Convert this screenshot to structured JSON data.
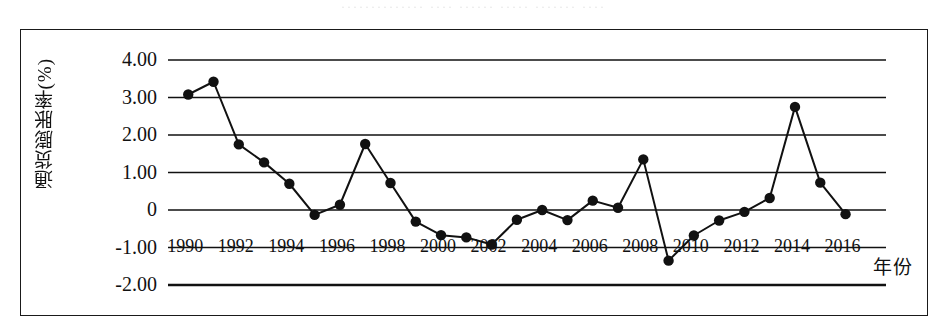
{
  "page": {
    "scan_artifact_text": "·············· ···· ······ ····· ······· ····",
    "background_color": "#ffffff",
    "line_color": "#111111",
    "frame_color": "#1a1a1a"
  },
  "chart_data": {
    "type": "line",
    "title": "",
    "xlabel": "年份",
    "ylabel": "通货膨胀率(%)",
    "x": [
      1990,
      1991,
      1992,
      1993,
      1994,
      1995,
      1996,
      1997,
      1998,
      1999,
      2000,
      2001,
      2002,
      2003,
      2004,
      2005,
      2006,
      2007,
      2008,
      2009,
      2010,
      2011,
      2012,
      2013,
      2014,
      2015,
      2016
    ],
    "values": [
      3.08,
      3.42,
      1.75,
      1.27,
      0.7,
      -0.13,
      0.14,
      1.76,
      0.72,
      -0.31,
      -0.67,
      -0.73,
      -0.92,
      -0.26,
      0.0,
      -0.27,
      0.25,
      0.06,
      1.35,
      -1.35,
      -0.68,
      -0.28,
      -0.05,
      0.32,
      2.75,
      0.73,
      -0.11
    ],
    "series_name": "通货膨胀率",
    "xlim": [
      1989.2,
      2017.6
    ],
    "ylim": [
      -2.0,
      4.0
    ],
    "yticks": [
      "4.00",
      "3.00",
      "2.00",
      "1.00",
      "0",
      "-1.00",
      "-2.00"
    ],
    "ytick_values": [
      4.0,
      3.0,
      2.0,
      1.0,
      0.0,
      -1.0,
      -2.0
    ],
    "xticks": [
      "1990",
      "1992",
      "1994",
      "1996",
      "1998",
      "2000",
      "2002",
      "2004",
      "2006",
      "2008",
      "2010",
      "2012",
      "2014",
      "2016"
    ],
    "xtick_values": [
      1990,
      1992,
      1994,
      1996,
      1998,
      2000,
      2002,
      2004,
      2006,
      2008,
      2010,
      2012,
      2014,
      2016
    ],
    "grid": true,
    "grid_orientation": "horizontal",
    "legend": false,
    "marker": "filled-circle",
    "marker_color": "#111111",
    "line_width": 2,
    "xaxis_label_position": "y=-1.00 gridline"
  }
}
